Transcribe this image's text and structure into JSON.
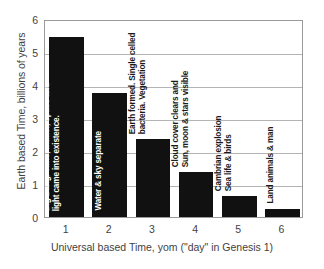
{
  "chart_data": {
    "type": "bar",
    "title": "",
    "subtitle": "",
    "xlabel": "Universal based Time, yom (\"day\" in Genesis 1)",
    "ylabel": "Earth based Time, billions of years",
    "categories": [
      "1",
      "2",
      "3",
      "4",
      "5",
      "6"
    ],
    "values": [
      5.45,
      3.75,
      2.35,
      1.35,
      0.63,
      0.25
    ],
    "ylim": [
      0,
      6
    ],
    "xlim": [
      0.5,
      6.5
    ],
    "y_ticks": [
      0,
      1,
      2,
      3,
      4,
      5,
      6
    ],
    "y_tick_labels": [
      "0",
      "1",
      "2",
      "3",
      "4",
      "5",
      "6"
    ],
    "x_tick_labels": [
      "1",
      "2",
      "3",
      "4",
      "5",
      "6"
    ],
    "grid": "horizontal",
    "legend": "none",
    "bar_color": "#111111",
    "bar_label_inside_color": "#ffffff",
    "bar_label_outside_color": "#1a1a1a",
    "axis_color": "#9a9a9a",
    "gridline_color": "#b4b4b4",
    "text_color": "#3f3f3f",
    "background_color": "#ffffff",
    "annotations": [
      {
        "category": "1",
        "value": 5.45,
        "text": "Big Bang.  Time, matter, space and light came into existence.",
        "lines": [
          "Big Bang.  Time, matter, space and",
          "light came into existence."
        ],
        "placement": "inside",
        "rotation": -90
      },
      {
        "category": "2",
        "value": 3.75,
        "text": "Water & sky separate",
        "lines": [
          "Water & sky separate"
        ],
        "placement": "inside",
        "rotation": -90
      },
      {
        "category": "3",
        "value": 2.35,
        "text": "Earth formed. Single celled bacteria.  Vegetation",
        "lines": [
          "Earth formed. Single celled",
          "bacteria.  Vegetation"
        ],
        "placement": "outside",
        "rotation": -90
      },
      {
        "category": "4",
        "value": 1.35,
        "text": "Cloud cover clears and Sun, moon & stars visible",
        "lines": [
          "Cloud cover clears and",
          "Sun, moon & stars visible"
        ],
        "placement": "outside",
        "rotation": -90
      },
      {
        "category": "5",
        "value": 0.63,
        "text": "Cambrian explosion Sea life & birds",
        "lines": [
          "Cambrian explosion",
          "Sea life & birds"
        ],
        "placement": "outside",
        "rotation": -90
      },
      {
        "category": "6",
        "value": 0.25,
        "text": "Land animals & man",
        "lines": [
          "Land animals & man"
        ],
        "placement": "outside",
        "rotation": -90
      }
    ]
  }
}
